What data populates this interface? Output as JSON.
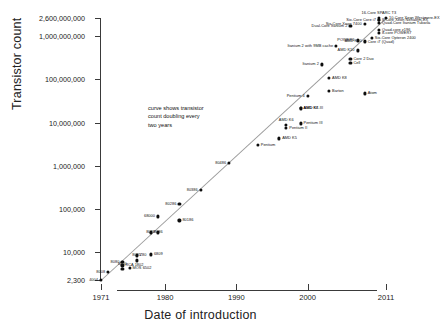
{
  "chart_data": {
    "type": "scatter",
    "title": "",
    "xlabel": "Date of introduction",
    "ylabel": "Transistor count",
    "xlim": [
      1971,
      2011
    ],
    "ylim": [
      2300,
      2600000000
    ],
    "yscale": "log",
    "grid": false,
    "legend": null,
    "annotation": "curve shows transistor\ncount doubling every\ntwo years",
    "xticks": [
      "1971",
      "1980",
      "1990",
      "2000",
      "2011"
    ],
    "xtick_values": [
      1971,
      1980,
      1990,
      2000,
      2011
    ],
    "yticks": [
      "2,300",
      "10,000",
      "100,000",
      "1,000,000",
      "10,000,000",
      "100,000,000",
      "1,000,000,000",
      "2,600,000,000"
    ],
    "ytick_values": [
      2300,
      10000,
      100000,
      1000000,
      10000000,
      100000000,
      1000000000,
      2600000000
    ],
    "trendline": {
      "label": "doubling every two years",
      "x": [
        1971,
        2011
      ],
      "y": [
        2300,
        2600000000
      ]
    },
    "points": [
      {
        "name": "4004",
        "x": 1971,
        "y": 2300,
        "side": "l"
      },
      {
        "name": "8008",
        "x": 1972,
        "y": 3500,
        "side": "l"
      },
      {
        "name": "RCA 1802",
        "x": 1974,
        "y": 5000,
        "side": "r"
      },
      {
        "name": "8080",
        "x": 1974,
        "y": 6000,
        "side": "l"
      },
      {
        "name": "MOS 6502",
        "x": 1975,
        "y": 4300,
        "side": "r"
      },
      {
        "name": "8085",
        "x": 1976,
        "y": 6500,
        "side": "c"
      },
      {
        "name": "6800",
        "x": 1974,
        "y": 4100,
        "side": "c"
      },
      {
        "name": "Z80",
        "x": 1976,
        "y": 8500,
        "side": "r"
      },
      {
        "name": "6809",
        "x": 1978,
        "y": 9000,
        "side": "r"
      },
      {
        "name": "8086",
        "x": 1978,
        "y": 29000,
        "side": "r"
      },
      {
        "name": "8088",
        "x": 1979,
        "y": 29000,
        "side": "l"
      },
      {
        "name": "68000",
        "x": 1979,
        "y": 68000,
        "side": "l"
      },
      {
        "name": "80186",
        "x": 1982,
        "y": 55000,
        "side": "r"
      },
      {
        "name": "80286",
        "x": 1982,
        "y": 134000,
        "side": "l"
      },
      {
        "name": "80386",
        "x": 1985,
        "y": 275000,
        "side": "l"
      },
      {
        "name": "80486",
        "x": 1989,
        "y": 1180000,
        "side": "l"
      },
      {
        "name": "Pentium",
        "x": 1993,
        "y": 3100000,
        "side": "r"
      },
      {
        "name": "AMD K5",
        "x": 1996,
        "y": 4300000,
        "side": "r"
      },
      {
        "name": "Pentium II",
        "x": 1997,
        "y": 7500000,
        "side": "r"
      },
      {
        "name": "AMD K6",
        "x": 1997,
        "y": 8800000,
        "side": "c"
      },
      {
        "name": "Pentium III",
        "x": 1999,
        "y": 9500000,
        "side": "r"
      },
      {
        "name": "AMD K6-III",
        "x": 1999,
        "y": 21300000,
        "side": "r"
      },
      {
        "name": "AMD K7",
        "x": 1999,
        "y": 22000000,
        "side": "r"
      },
      {
        "name": "Pentium 4",
        "x": 2000,
        "y": 42000000,
        "side": "l"
      },
      {
        "name": "Barton",
        "x": 2003,
        "y": 54300000,
        "side": "r"
      },
      {
        "name": "Atom",
        "x": 2008,
        "y": 47000000,
        "side": "r"
      },
      {
        "name": "AMD K8",
        "x": 2003,
        "y": 105900000,
        "side": "r"
      },
      {
        "name": "Itanium 2",
        "x": 2002,
        "y": 220000000,
        "side": "l"
      },
      {
        "name": "Cell",
        "x": 2006,
        "y": 241000000,
        "side": "r"
      },
      {
        "name": "Core 2 Duo",
        "x": 2006,
        "y": 291000000,
        "side": "r"
      },
      {
        "name": "Itanium 2 with 9MB cache",
        "x": 2004,
        "y": 592000000,
        "side": "l"
      },
      {
        "name": "POWER6",
        "x": 2007,
        "y": 789000000,
        "side": "l"
      },
      {
        "name": "AMD K10",
        "x": 2007,
        "y": 463000000,
        "side": "l"
      },
      {
        "name": "AMD K10",
        "x": 2008,
        "y": 758000000,
        "side": "l"
      },
      {
        "name": "Core i7 (Quad)",
        "x": 2008,
        "y": 731000000,
        "side": "r"
      },
      {
        "name": "Six-Core Opteron 2400",
        "x": 2009,
        "y": 904000000,
        "side": "r"
      },
      {
        "name": "Dual-Core Itanium 2",
        "x": 2006,
        "y": 1700000000,
        "side": "l"
      },
      {
        "name": "Six-Core Xeon 7400",
        "x": 2008,
        "y": 1900000000,
        "side": "l"
      },
      {
        "name": "Six-Core Core i7",
        "x": 2010,
        "y": 2300000000,
        "side": "l"
      },
      {
        "name": "8-Core Xeon Nehalem-EX",
        "x": 2010,
        "y": 2300000000,
        "side": "r"
      },
      {
        "name": "Quad-Core Itanium Tukwila",
        "x": 2010,
        "y": 2000000000,
        "side": "r"
      },
      {
        "name": "Quad-core z196",
        "x": 2010,
        "y": 1400000000,
        "side": "r"
      },
      {
        "name": "8-core POWER7",
        "x": 2010,
        "y": 1200000000,
        "side": "r"
      },
      {
        "name": "10-Core Xeon Westmere-EX",
        "x": 2011,
        "y": 2600000000,
        "side": "r"
      },
      {
        "name": "16-Core SPARC T3",
        "x": 2010,
        "y": 2600000000,
        "side": "c"
      }
    ]
  }
}
